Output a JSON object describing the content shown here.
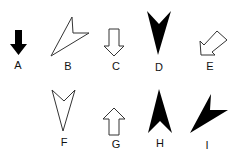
{
  "figure": {
    "items": [
      {
        "label": "A",
        "style": "filled",
        "direction": "down",
        "shape": "block-arrow"
      },
      {
        "label": "B",
        "style": "outline",
        "direction": "down-left",
        "shape": "arrowhead"
      },
      {
        "label": "C",
        "style": "outline",
        "direction": "down",
        "shape": "block-arrow"
      },
      {
        "label": "D",
        "style": "filled",
        "direction": "down",
        "shape": "arrowhead"
      },
      {
        "label": "E",
        "style": "outline",
        "direction": "down-left",
        "shape": "block-arrow"
      },
      {
        "label": "F",
        "style": "outline",
        "direction": "down",
        "shape": "arrowhead"
      },
      {
        "label": "G",
        "style": "outline",
        "direction": "up",
        "shape": "block-arrow"
      },
      {
        "label": "H",
        "style": "filled",
        "direction": "up",
        "shape": "arrowhead"
      },
      {
        "label": "I",
        "style": "filled",
        "direction": "down-left",
        "shape": "arrowhead"
      }
    ],
    "colors": {
      "fill": "#000000",
      "stroke": "#333333",
      "background": "#ffffff"
    }
  }
}
